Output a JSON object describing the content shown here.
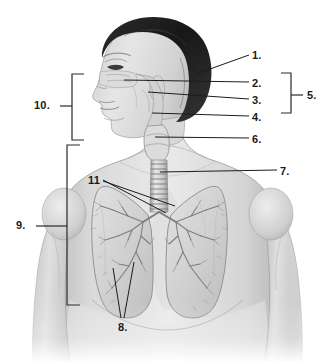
{
  "figure": {
    "background_color": "#ffffff",
    "line_color": "#1a1a1a",
    "label_color": "#1a1a1a",
    "width": 335,
    "height": 363
  },
  "labels": [
    {
      "id": "1",
      "text": "1.",
      "x": 252,
      "y": 50,
      "kind": "leader"
    },
    {
      "id": "2",
      "text": "2.",
      "x": 252,
      "y": 78,
      "kind": "leader"
    },
    {
      "id": "3",
      "text": "3.",
      "x": 252,
      "y": 95,
      "kind": "leader"
    },
    {
      "id": "4",
      "text": "4.",
      "x": 252,
      "y": 112,
      "kind": "leader"
    },
    {
      "id": "5",
      "text": "5.",
      "x": 307,
      "y": 90,
      "kind": "bracket"
    },
    {
      "id": "6",
      "text": "6.",
      "x": 252,
      "y": 134,
      "kind": "leader"
    },
    {
      "id": "7",
      "text": "7.",
      "x": 280,
      "y": 166,
      "kind": "leader"
    },
    {
      "id": "8",
      "text": "8.",
      "x": 118,
      "y": 322,
      "kind": "leader"
    },
    {
      "id": "9",
      "text": "9.",
      "x": 16,
      "y": 220,
      "kind": "bracket"
    },
    {
      "id": "10",
      "text": "10.",
      "x": 34,
      "y": 100,
      "kind": "bracket"
    },
    {
      "id": "11",
      "text": "11",
      "x": 88,
      "y": 175,
      "kind": "leader"
    }
  ],
  "brackets": [
    {
      "id": "bracket-10",
      "label": "10.",
      "side": "left",
      "x": 72,
      "top": 74,
      "bottom": 140,
      "tick_y": 106
    },
    {
      "id": "bracket-9",
      "label": "9.",
      "side": "left",
      "x": 67,
      "top": 145,
      "bottom": 305,
      "tick_y": 226
    },
    {
      "id": "bracket-5",
      "label": "5.",
      "side": "right",
      "x": 291,
      "top": 73,
      "bottom": 113,
      "tick_y": 95
    }
  ],
  "leaders": [
    {
      "id": "leader-1",
      "label": "1.",
      "from": [
        249,
        55
      ],
      "to": [
        196,
        74
      ]
    },
    {
      "id": "leader-2",
      "label": "2.",
      "from": [
        249,
        82
      ],
      "to": [
        124,
        80
      ]
    },
    {
      "id": "leader-3",
      "label": "3.",
      "from": [
        249,
        99
      ],
      "to": [
        148,
        92
      ]
    },
    {
      "id": "leader-4",
      "label": "4.",
      "from": [
        249,
        116
      ],
      "to": [
        152,
        113
      ]
    },
    {
      "id": "leader-6",
      "label": "6.",
      "from": [
        249,
        138
      ],
      "to": [
        155,
        137
      ]
    },
    {
      "id": "leader-7",
      "label": "7.",
      "from": [
        277,
        170
      ],
      "to": [
        160,
        172
      ]
    },
    {
      "id": "leader-8a",
      "label": "8.",
      "from": [
        121,
        318
      ],
      "to": [
        113,
        268
      ]
    },
    {
      "id": "leader-8b",
      "label": "8.",
      "from": [
        124,
        318
      ],
      "to": [
        134,
        262
      ]
    },
    {
      "id": "leader-11a",
      "label": "11",
      "from": [
        103,
        180
      ],
      "to": [
        166,
        213
      ]
    },
    {
      "id": "leader-11b",
      "label": "11",
      "from": [
        103,
        181
      ],
      "to": [
        175,
        206
      ]
    }
  ],
  "anatomy_parts": [
    {
      "name": "head-profile"
    },
    {
      "name": "hair"
    },
    {
      "name": "nasal-cavity"
    },
    {
      "name": "pharynx"
    },
    {
      "name": "larynx"
    },
    {
      "name": "trachea"
    },
    {
      "name": "left-lung"
    },
    {
      "name": "right-lung"
    },
    {
      "name": "bronchial-tree"
    },
    {
      "name": "torso"
    },
    {
      "name": "left-arm"
    },
    {
      "name": "right-arm"
    }
  ]
}
